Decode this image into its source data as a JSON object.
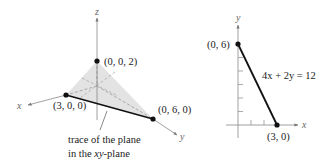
{
  "left_diagram": {
    "title": "Plane 4x + 2y + 6z = 12 intercepts in 3D",
    "axes": {
      "x": "x",
      "y": "y",
      "z": "z"
    },
    "points": [
      {
        "label": "(0, 0, 2)"
      },
      {
        "label": "(3, 0, 0)"
      },
      {
        "label": "(0, 6, 0)"
      }
    ],
    "annotation_line1": "trace of the plane",
    "annotation_line2_prefix": "in the ",
    "annotation_line2_var": "xy",
    "annotation_line2_suffix": "-plane",
    "colors": {
      "plane_fill": "#e3e3e3",
      "trace": "#111111",
      "axis": "#888888"
    }
  },
  "right_diagram": {
    "axes": {
      "x": "x",
      "y": "y"
    },
    "points": [
      {
        "label": "(0, 6)"
      },
      {
        "label": "(3, 0)"
      }
    ],
    "equation": "4x + 2y = 12"
  }
}
